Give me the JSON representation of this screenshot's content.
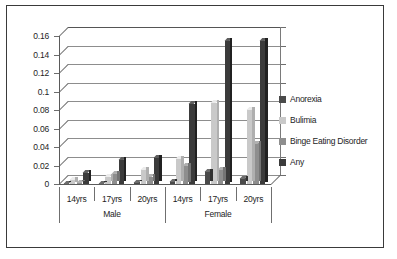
{
  "chart_data": {
    "type": "bar",
    "title": "",
    "subtitle": "",
    "xlabel": "",
    "ylabel": "",
    "ylim": [
      0,
      0.16
    ],
    "ytick_labels": [
      "0.16",
      "0.14",
      "0.12",
      "0.1",
      "0.08",
      "0.06",
      "0.04",
      "0.02",
      "0"
    ],
    "ytick_values": [
      0.16,
      0.14,
      0.12,
      0.1,
      0.08,
      0.06,
      0.04,
      0.02,
      0
    ],
    "grid": true,
    "legend_position": "right",
    "groups": [
      {
        "label": "Male",
        "categories": [
          "14yrs",
          "17yrs",
          "20yrs"
        ]
      },
      {
        "label": "Female",
        "categories": [
          "14yrs",
          "17yrs",
          "20yrs"
        ]
      }
    ],
    "categories": [
      "14yrs",
      "17yrs",
      "20yrs",
      "14yrs",
      "17yrs",
      "20yrs"
    ],
    "series": [
      {
        "name": "Anorexia",
        "color": "#4a4a4a",
        "values": [
          0.001,
          0.001,
          0.002,
          0.003,
          0.014,
          0.006
        ]
      },
      {
        "name": "Bulimia",
        "color": "#c9c9c9",
        "values": [
          0.005,
          0.008,
          0.016,
          0.028,
          0.088,
          0.081
        ]
      },
      {
        "name": "Binge Eating Disorder",
        "color": "#8e8e8e",
        "values": [
          0.002,
          0.011,
          0.008,
          0.02,
          0.016,
          0.044
        ]
      },
      {
        "name": "Any",
        "color": "#3b3b3b",
        "values": [
          0.012,
          0.026,
          0.029,
          0.087,
          0.155,
          0.155
        ]
      }
    ]
  },
  "legend": {
    "items": [
      {
        "label": "Anorexia",
        "color": "#4a4a4a"
      },
      {
        "label": "Bulimia",
        "color": "#c9c9c9"
      },
      {
        "label": "Binge Eating Disorder",
        "color": "#8e8e8e"
      },
      {
        "label": "Any",
        "color": "#3b3b3b"
      }
    ]
  }
}
